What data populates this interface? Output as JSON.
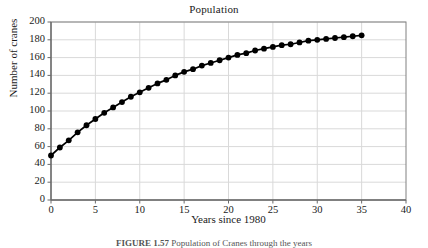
{
  "figure": {
    "title": "Population",
    "xlabel": "Years since 1980",
    "ylabel": "Number of cranes",
    "caption_label": "FIGURE 1.57",
    "caption_text": "Population of Cranes through the years"
  },
  "colors": {
    "line": "#000000",
    "marker": "#000000",
    "grid": "#d9d9d9",
    "axis": "#808080",
    "background": "#ffffff",
    "text": "#1a1a1a"
  },
  "chart_data": {
    "type": "line",
    "title": "Population",
    "xlabel": "Years since 1980",
    "ylabel": "Number of cranes",
    "xlim": [
      0,
      40
    ],
    "ylim": [
      0,
      200
    ],
    "xticks": [
      0,
      5,
      10,
      15,
      20,
      25,
      30,
      35,
      40
    ],
    "yticks": [
      0,
      20,
      40,
      60,
      80,
      100,
      120,
      140,
      160,
      180,
      200
    ],
    "grid": true,
    "legend": null,
    "marker": "filled-circle",
    "series": [
      {
        "name": "Number of cranes",
        "x": [
          0,
          1,
          2,
          3,
          4,
          5,
          6,
          7,
          8,
          9,
          10,
          11,
          12,
          13,
          14,
          15,
          16,
          17,
          18,
          19,
          20,
          21,
          22,
          23,
          24,
          25,
          26,
          27,
          28,
          29,
          30,
          31,
          32,
          33,
          34,
          35
        ],
        "values": [
          50,
          59,
          67,
          76,
          84,
          91,
          98,
          104,
          110,
          116,
          121,
          126,
          131,
          135,
          140,
          144,
          147,
          151,
          154,
          157,
          160,
          163,
          165,
          168,
          170,
          172,
          174,
          175,
          177,
          179,
          180,
          181,
          182,
          183,
          184,
          185
        ]
      }
    ]
  }
}
